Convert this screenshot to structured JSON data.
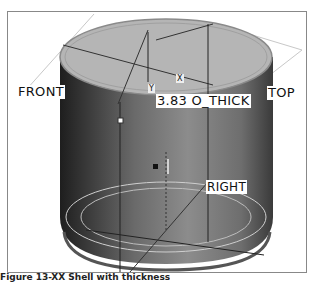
{
  "labels": {
    "front": "FRONT",
    "top": "TOP",
    "right": "RIGHT",
    "dimension": "3.83 O_THICK",
    "axis_y": "Y",
    "axis_x": "X"
  },
  "caption": "Figure 13-XX  Shell with thickness",
  "colors": {
    "top_face": "#b4b4b4",
    "body_dark": "#3a3a3a",
    "body_mid": "#777777",
    "plane_line": "#c8c8c8",
    "datum_line": "#222222"
  }
}
